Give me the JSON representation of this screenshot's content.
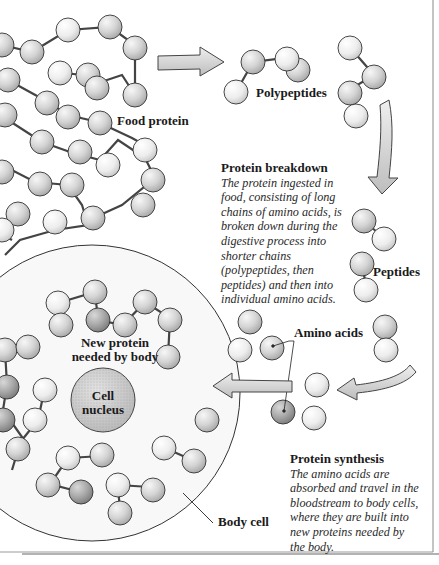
{
  "labels": {
    "food_protein": "Food protein",
    "polypeptides": "Polypeptides",
    "peptides": "Peptides",
    "amino_acids": "Amino acids",
    "new_protein_line1": "New protein",
    "new_protein_line2": "needed by body",
    "cell_nucleus_line1": "Cell",
    "cell_nucleus_line2": "nucleus",
    "body_cell": "Body cell"
  },
  "captions": {
    "breakdown": {
      "title": "Protein breakdown",
      "lines": [
        "The protein ingested in",
        "food, consisting of long",
        "chains of amino acids, is",
        "broken down during the",
        "digestive process into",
        "shorter chains",
        "(polypeptides, then",
        "peptides) and then into",
        "individual amino acids."
      ]
    },
    "synthesis": {
      "title": "Protein synthesis",
      "lines": [
        "The amino acids are",
        "absorbed and travel in the",
        "bloodstream to body cells,",
        "where they are built into",
        "new proteins needed by",
        "the body."
      ]
    }
  },
  "colors": {
    "ball_light": "#f4f4f4",
    "ball_mid": "#d6d6d6",
    "ball_dark": "#a9a9a9",
    "outline": "#333333",
    "arrow_fill": "#d9d9d9",
    "nucleus_fill": "#cfcfcf",
    "cell_fill": "#f7f7f7"
  },
  "icons": {
    "arrow_right": "arrow-right-icon",
    "arrow_down": "arrow-down-icon",
    "arrow_left": "arrow-left-icon"
  }
}
